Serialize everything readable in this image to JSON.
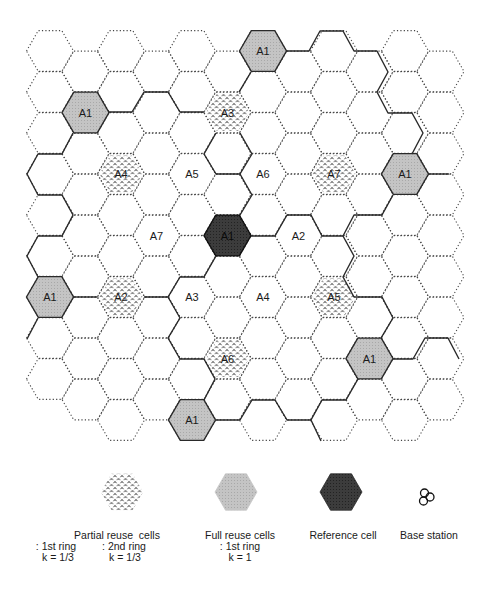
{
  "diagram": {
    "type": "hexagonal cellular frequency reuse layout",
    "grid": {
      "columns": 12,
      "origin_x": 50,
      "origin_y_even": 51,
      "origin_y_odd": 71.5,
      "col_step": 35.5,
      "row_step": 41,
      "radius": 23.5,
      "rows_even_col": 10,
      "rows_odd_col": 9,
      "omitted": [
        [
          0,
          9
        ]
      ]
    },
    "colors": {
      "dotted_edge": "#444444",
      "bold_edge": "#2a2a2a",
      "full_reuse_fill": "#bdbdbd",
      "reference_fill": "#3a3a3a",
      "stipple_mark": "#222222",
      "label": "#1a1a1a"
    },
    "cells": [
      {
        "col": 6,
        "row": 0,
        "label": "A1",
        "kind": "full"
      },
      {
        "col": 1,
        "row": 1,
        "label": "A1",
        "kind": "full"
      },
      {
        "col": 5,
        "row": 1,
        "label": "A3",
        "kind": "partial"
      },
      {
        "col": 2,
        "row": 3,
        "label": "A4",
        "kind": "partial"
      },
      {
        "col": 4,
        "row": 3,
        "label": "A5",
        "kind": "plain"
      },
      {
        "col": 6,
        "row": 3,
        "label": "A6",
        "kind": "plain"
      },
      {
        "col": 8,
        "row": 3,
        "label": "A7",
        "kind": "partial"
      },
      {
        "col": 10,
        "row": 3,
        "label": "A1",
        "kind": "full"
      },
      {
        "col": 3,
        "row": 4,
        "label": "A7",
        "kind": "plain"
      },
      {
        "col": 5,
        "row": 4,
        "label": "A1",
        "kind": "reference"
      },
      {
        "col": 7,
        "row": 4,
        "label": "A2",
        "kind": "plain"
      },
      {
        "col": 0,
        "row": 6,
        "label": "A1",
        "kind": "full"
      },
      {
        "col": 2,
        "row": 6,
        "label": "A2",
        "kind": "partial"
      },
      {
        "col": 4,
        "row": 6,
        "label": "A3",
        "kind": "plain"
      },
      {
        "col": 6,
        "row": 6,
        "label": "A4",
        "kind": "plain"
      },
      {
        "col": 8,
        "row": 6,
        "label": "A5",
        "kind": "partial"
      },
      {
        "col": 5,
        "row": 7,
        "label": "A6",
        "kind": "partial"
      },
      {
        "col": 9,
        "row": 7,
        "label": "A1",
        "kind": "full"
      },
      {
        "col": 4,
        "row": 9,
        "label": "A1",
        "kind": "full"
      }
    ],
    "bold_paths": [
      [
        [
          286,
          51
        ],
        [
          309,
          51
        ],
        [
          320,
          31
        ],
        [
          343,
          31
        ],
        [
          354,
          51
        ],
        [
          377,
          51
        ],
        [
          388,
          72
        ],
        [
          377,
          92
        ],
        [
          388,
          113
        ],
        [
          412,
          113
        ],
        [
          423,
          133
        ],
        [
          412,
          154
        ]
      ],
      [
        [
          428,
          174
        ],
        [
          449,
          174
        ]
      ],
      [
        [
          393,
          195
        ],
        [
          382,
          215
        ],
        [
          354,
          215
        ],
        [
          343,
          236
        ],
        [
          354,
          256
        ],
        [
          343,
          277
        ],
        [
          354,
          297
        ],
        [
          382,
          297
        ],
        [
          393,
          318
        ],
        [
          381,
          338
        ]
      ],
      [
        [
          393,
          359
        ],
        [
          413,
          359
        ],
        [
          425,
          338
        ],
        [
          448,
          338
        ],
        [
          459,
          359
        ]
      ],
      [
        [
          358,
          379
        ],
        [
          346,
          400
        ],
        [
          322,
          400
        ],
        [
          311,
          420
        ],
        [
          321,
          441
        ]
      ],
      [
        [
          311,
          420
        ],
        [
          287,
          420
        ],
        [
          275,
          400
        ],
        [
          252,
          400
        ],
        [
          240,
          420
        ],
        [
          216,
          420
        ]
      ],
      [
        [
          204,
          400
        ],
        [
          215,
          379
        ],
        [
          204,
          359
        ],
        [
          180,
          359
        ],
        [
          168,
          338
        ],
        [
          180,
          318
        ],
        [
          168,
          297
        ],
        [
          144,
          297
        ]
      ],
      [
        [
          168,
          297
        ],
        [
          180,
          277
        ],
        [
          204,
          277
        ],
        [
          216,
          256
        ]
      ],
      [
        [
          251,
          236
        ],
        [
          275,
          236
        ],
        [
          287,
          215
        ],
        [
          311,
          215
        ],
        [
          322,
          236
        ],
        [
          343,
          236
        ]
      ],
      [
        [
          97,
          297
        ],
        [
          73,
          297
        ]
      ],
      [
        [
          38,
          277
        ],
        [
          27,
          256
        ],
        [
          38,
          236
        ],
        [
          62,
          236
        ],
        [
          73,
          215
        ],
        [
          62,
          195
        ],
        [
          38,
          195
        ],
        [
          27,
          174
        ],
        [
          38,
          154
        ],
        [
          62,
          154
        ],
        [
          73,
          133
        ]
      ],
      [
        [
          38,
          318
        ],
        [
          27,
          339
        ]
      ],
      [
        [
          108,
          112
        ],
        [
          132,
          112
        ],
        [
          144,
          92
        ],
        [
          168,
          92
        ],
        [
          180,
          112
        ],
        [
          204,
          112
        ]
      ],
      [
        [
          251,
          72
        ],
        [
          239,
          92
        ]
      ],
      [
        [
          216,
          133
        ],
        [
          204,
          154
        ],
        [
          216,
          174
        ],
        [
          240,
          174
        ],
        [
          252,
          154
        ],
        [
          240,
          133
        ]
      ],
      [
        [
          240,
          215
        ],
        [
          252,
          195
        ],
        [
          240,
          174
        ]
      ]
    ]
  },
  "legend": {
    "items": [
      {
        "swatch": "partial",
        "cx": 122,
        "cy": 492
      },
      {
        "swatch": "full",
        "cx": 236,
        "cy": 492
      },
      {
        "swatch": "reference",
        "cx": 341,
        "cy": 492
      },
      {
        "swatch": "base-station",
        "cx": 426,
        "cy": 497
      }
    ],
    "partial_title": "Partial reuse  cells",
    "partial_ring1": ": 1st ring",
    "partial_ring2": ": 2nd ring",
    "partial_k1": "k = 1/3",
    "partial_k2": "k = 1/3",
    "full_title": "Full reuse cells",
    "full_ring": ": 1st ring",
    "full_k": "k = 1",
    "reference_title": "Reference cell",
    "base_station_title": "Base station"
  }
}
